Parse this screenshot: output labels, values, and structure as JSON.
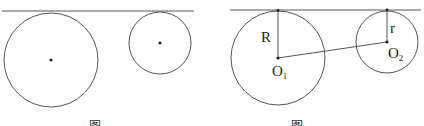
{
  "figures": [
    {
      "name": "left-figure",
      "tangent_line": {
        "x1": 2,
        "y1": 11,
        "x2": 194,
        "y2": 11
      },
      "circles": [
        {
          "cx": 51,
          "cy": 60,
          "r": 47
        },
        {
          "cx": 160,
          "cy": 43,
          "r": 31
        }
      ],
      "caption": "图"
    },
    {
      "name": "right-figure",
      "tangent_line": {
        "x1": 230,
        "y1": 10,
        "x2": 421,
        "y2": 10
      },
      "circles": [
        {
          "cx": 278,
          "cy": 58,
          "r": 47
        },
        {
          "cx": 387,
          "cy": 42,
          "r": 31
        }
      ],
      "labels": {
        "big_radius": "R",
        "small_radius": "r",
        "big_center": "O",
        "big_center_sub": "1",
        "small_center": "O",
        "small_center_sub": "2"
      },
      "caption": "图"
    }
  ],
  "colors": {
    "stroke": "#555555",
    "dot": "#222222"
  }
}
